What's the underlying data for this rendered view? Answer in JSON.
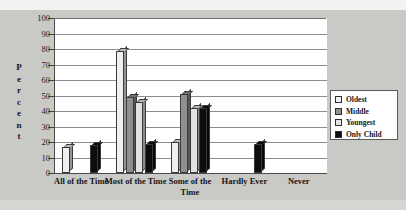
{
  "chart_data": {
    "type": "bar",
    "title": "",
    "subtitle": "",
    "xlabel": "",
    "ylabel": "Percent",
    "ylim": [
      0,
      100
    ],
    "yticks": [
      0,
      10,
      20,
      30,
      40,
      50,
      60,
      70,
      80,
      90,
      100
    ],
    "grid": true,
    "legend_position": "right",
    "categories": [
      "All of the Time",
      "Most of the Time",
      "Some of the Time",
      "Hardly Ever",
      "Never"
    ],
    "series": [
      {
        "name": "Oldest",
        "color": "#efefef",
        "values": [
          17,
          79,
          20,
          0,
          0
        ]
      },
      {
        "name": "Middle",
        "color": "#8f8f8f",
        "values": [
          0,
          49,
          51,
          0,
          0
        ]
      },
      {
        "name": "Youngest",
        "color": "#e2e2e2",
        "values": [
          0,
          46,
          42,
          0,
          0
        ]
      },
      {
        "name": "Only Child",
        "color": "#0d0d0d",
        "values": [
          18,
          19,
          42,
          19,
          0
        ]
      }
    ]
  },
  "ylabel_letters": [
    "P",
    "e",
    "r",
    "c",
    "e",
    "n",
    "t"
  ],
  "legend": {
    "items": [
      {
        "label": "Oldest",
        "color": "#efefef"
      },
      {
        "label": "Middle",
        "color": "#8f8f8f"
      },
      {
        "label": "Youngest",
        "color": "#e2e2e2"
      },
      {
        "label": "Only Child",
        "color": "#0d0d0d"
      }
    ]
  }
}
